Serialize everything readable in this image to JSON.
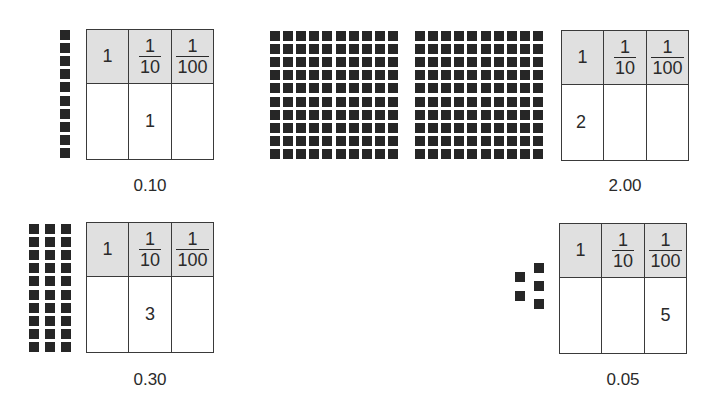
{
  "header_labels": {
    "ones": "1",
    "tenths_num": "1",
    "tenths_den": "10",
    "hundredths_num": "1",
    "hundredths_den": "100"
  },
  "panels": [
    {
      "id": "p1",
      "caption": "0.10",
      "digits": {
        "ones": "",
        "tenths": "1",
        "hundredths": ""
      },
      "blocks": "1 rod of 10 hundredths (1 tenth)"
    },
    {
      "id": "p2",
      "caption": "2.00",
      "digits": {
        "ones": "2",
        "tenths": "",
        "hundredths": ""
      },
      "blocks": "2 flats of 10x10 hundredths (2 ones)"
    },
    {
      "id": "p3",
      "caption": "0.30",
      "digits": {
        "ones": "",
        "tenths": "3",
        "hundredths": ""
      },
      "blocks": "3 rods of 10 hundredths (3 tenths)"
    },
    {
      "id": "p4",
      "caption": "0.05",
      "digits": {
        "ones": "",
        "tenths": "",
        "hundredths": "5"
      },
      "blocks": "5 unit squares (5 hundredths)"
    }
  ],
  "colors": {
    "block": "#262626",
    "header_bg": "#e0e0e0",
    "border": "#3a3a3a"
  }
}
